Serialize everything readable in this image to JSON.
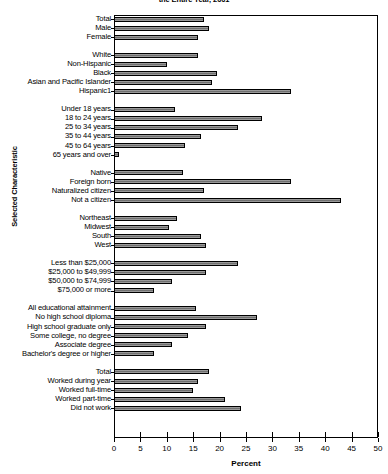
{
  "chart_data": {
    "type": "bar",
    "orientation": "horizontal",
    "title": "the Entire Year, 2001",
    "xlabel": "Percent",
    "ylabel": "Selected Characteristic",
    "xlim": [
      0,
      50
    ],
    "xticks": [
      0,
      5,
      10,
      15,
      20,
      25,
      30,
      35,
      40,
      45,
      50
    ],
    "grid": false,
    "legend": "none",
    "bar_color": "#7d7d7d",
    "bar_edge_color": "#000000",
    "groups": [
      {
        "name": "sex",
        "categories": [
          "Total",
          "Male",
          "Female"
        ],
        "values": [
          17.0,
          18.0,
          16.0
        ]
      },
      {
        "name": "race-ethnicity",
        "categories": [
          "White",
          "Non-Hispanic",
          "Black",
          "Asian and Pacific Islander",
          "Hispanic1"
        ],
        "values": [
          16.0,
          10.0,
          19.5,
          18.5,
          33.5
        ]
      },
      {
        "name": "age",
        "categories": [
          "Under 18 years",
          "18 to 24 years",
          "25 to 34 years",
          "35 to 44 years",
          "45 to 64 years",
          "65 years and over"
        ],
        "values": [
          11.5,
          28.0,
          23.5,
          16.5,
          13.5,
          1.0
        ]
      },
      {
        "name": "nativity",
        "categories": [
          "Native",
          "Foreign born",
          "Naturalized citizen",
          "Not a citizen"
        ],
        "values": [
          13.0,
          33.5,
          17.0,
          43.0
        ]
      },
      {
        "name": "region",
        "categories": [
          "Northeast",
          "Midwest",
          "South",
          "West"
        ],
        "values": [
          12.0,
          10.5,
          16.5,
          17.5
        ]
      },
      {
        "name": "household-income",
        "categories": [
          "Less than $25,000",
          "$25,000 to $49,999",
          "$50,000 to $74,999",
          "$75,000 or more"
        ],
        "values": [
          23.5,
          17.5,
          11.0,
          7.5
        ]
      },
      {
        "name": "education",
        "categories": [
          "All educational attainment",
          "No high school diploma",
          "High school graduate only",
          "Some college, no degree",
          "Associate degree",
          "Bachelor's degree or higher"
        ],
        "values": [
          15.5,
          27.0,
          17.5,
          14.0,
          11.0,
          7.5
        ]
      },
      {
        "name": "work-experience",
        "categories": [
          "Total",
          "Worked during year",
          "Worked full-time",
          "Worked part-time",
          "Did not work"
        ],
        "values": [
          18.0,
          16.0,
          15.0,
          21.0,
          24.0
        ]
      }
    ]
  }
}
